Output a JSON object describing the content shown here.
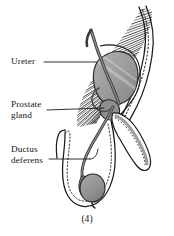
{
  "figure": {
    "caption": "(4)",
    "background_color": "#ffffff",
    "ink_color": "#1a1a1a",
    "organ_fill_color": "#9a9a9a",
    "duct_color": "#6e6e6e",
    "hatch_color": "#2b2b2b",
    "labels": [
      {
        "id": "ureter",
        "text": "Ureter",
        "lines": [
          "Ureter"
        ],
        "leader_from": [
          44,
          62
        ],
        "leader_to": [
          97,
          62
        ]
      },
      {
        "id": "prostate-gland",
        "text": "Prostate gland",
        "lines": [
          "Prostate",
          "gland"
        ],
        "leader_from": [
          47,
          110
        ],
        "leader_to": [
          104,
          108
        ]
      },
      {
        "id": "ductus-deferens",
        "text": "Ductus deferens",
        "lines": [
          "Ductus",
          "deferens"
        ],
        "leader_from": [
          49,
          159
        ],
        "leader_to": [
          96,
          159
        ]
      }
    ],
    "structures": [
      {
        "name": "bladder",
        "kind": "organ",
        "fill": "#9a9a9a"
      },
      {
        "name": "prostate-gland",
        "kind": "organ",
        "fill": "#8f8f8f"
      },
      {
        "name": "testis",
        "kind": "organ",
        "fill": "#9a9a9a"
      },
      {
        "name": "epididymis",
        "kind": "organ",
        "fill": "#8a8a8a"
      },
      {
        "name": "ureter",
        "kind": "duct",
        "fill": "#6e6e6e"
      },
      {
        "name": "ductus-deferens",
        "kind": "duct",
        "fill": "#6e6e6e"
      },
      {
        "name": "urethra",
        "kind": "duct",
        "fill": "#9e9e9e"
      },
      {
        "name": "penis",
        "kind": "outline",
        "fill": "#ffffff"
      },
      {
        "name": "scrotum",
        "kind": "outline",
        "fill": "#ffffff"
      },
      {
        "name": "abdominal-muscle-hatching",
        "kind": "hatching",
        "fill": "#2b2b2b"
      }
    ]
  }
}
